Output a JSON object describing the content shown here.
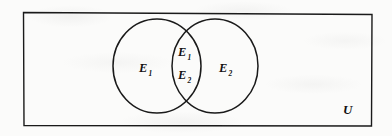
{
  "diagram": {
    "kind": "venn-diagram",
    "title_visible": false,
    "universe": {
      "label": "U",
      "label_position": "bottom-right-inside",
      "shape": "rectangle"
    },
    "sets": [
      {
        "id": "left-set",
        "label_letter": "E",
        "label_subscript": "1",
        "label_full": "E₁",
        "shape": "circle",
        "position": "left"
      },
      {
        "id": "right-set",
        "label_letter": "E",
        "label_subscript": "2",
        "label_full": "E₂",
        "shape": "circle",
        "position": "right"
      }
    ],
    "intersection": {
      "id": "intersection-region",
      "shape": "lens",
      "labels": [
        {
          "letter": "E",
          "subscript": "1",
          "full": "E₁",
          "stack_position": "upper"
        },
        {
          "letter": "E",
          "subscript": "2",
          "full": "E₂",
          "stack_position": "lower"
        }
      ]
    },
    "colors": {
      "stroke": "#1a1a1a",
      "background": "#fbfbfa",
      "text": "#121212"
    }
  }
}
